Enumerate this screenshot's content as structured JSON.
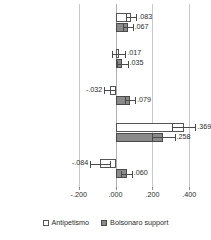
{
  "chart_data": {
    "type": "bar",
    "orientation": "horizontal",
    "title": "",
    "xlabel": "",
    "ylabel": "",
    "xlim": [
      -0.28,
      0.48
    ],
    "grid": true,
    "gridlines": [
      -0.2,
      0.0,
      0.2,
      0.4
    ],
    "xticks": [
      -0.2,
      0.0,
      0.2,
      0.4
    ],
    "xticklabels": [
      "-.200",
      ".000",
      ".200",
      ".400"
    ],
    "legend_position": "bottom",
    "categories": [
      "Anti-crime att.",
      "Anti-imm. att.",
      "Ethnonationalism",
      "Anti-corruption",
      "Economic discontent"
    ],
    "series": [
      {
        "name": "Antipetismo",
        "color": "#ffffff",
        "values": [
          0.083,
          0.017,
          -0.032,
          0.369,
          -0.084
        ],
        "labels": [
          ".083",
          ".017",
          "-.032",
          ".369",
          "-.084"
        ],
        "ci_low": [
          0.055,
          -0.018,
          -0.061,
          0.305,
          -0.137
        ],
        "ci_high": [
          0.112,
          0.052,
          -0.003,
          0.432,
          -0.031
        ]
      },
      {
        "name": "Bolsonaro support",
        "color": "#8a8a8a",
        "values": [
          0.067,
          0.035,
          0.079,
          0.258,
          0.06
        ],
        "labels": [
          ".067",
          ".035",
          ".079",
          ".258",
          ".060"
        ],
        "ci_low": [
          0.042,
          0.005,
          0.053,
          0.196,
          0.032
        ],
        "ci_high": [
          0.092,
          0.065,
          0.105,
          0.32,
          0.088
        ]
      }
    ]
  },
  "legend": {
    "items": [
      {
        "label": "Antipetismo",
        "swatch": "white-square-marker"
      },
      {
        "label": "Bolsonaro support",
        "swatch": "gray-square-marker"
      }
    ]
  }
}
